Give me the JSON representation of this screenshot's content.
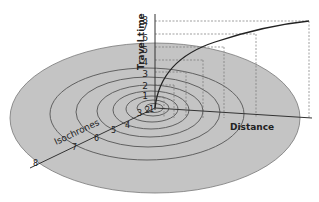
{
  "diagram": {
    "axis_y_label": "Travel time",
    "axis_x_label": "Distance",
    "isochrone_label": "Isochrones",
    "y_ticks": [
      "1",
      "2",
      "3",
      "4",
      "5",
      "6",
      "7",
      "8"
    ],
    "isochrone_ticks": [
      "1",
      "2",
      "3",
      "4",
      "5",
      "6",
      "7",
      "8"
    ],
    "colors": {
      "disc_fill": "#c4c4c4",
      "line": "#333333",
      "guide": "#777777",
      "background": "#ffffff"
    }
  }
}
